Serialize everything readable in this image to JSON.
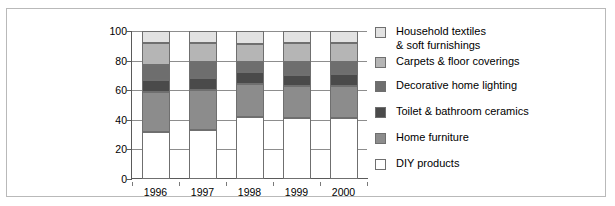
{
  "chart_data": {
    "type": "bar",
    "subtype": "stacked-bar-100",
    "title": "",
    "xlabel": "",
    "ylabel": "",
    "categories": [
      "1996",
      "1997",
      "1998",
      "1999",
      "2000"
    ],
    "ylim": [
      0,
      100
    ],
    "yticks": [
      0,
      20,
      40,
      60,
      80,
      100
    ],
    "ytick_labels": [
      "0",
      "20",
      "40",
      "60",
      "80",
      "100"
    ],
    "grid": true,
    "legend_position": "right",
    "stack_order_bottom_to_top": [
      "DIY products",
      "Home furniture",
      "Toilet & bathroom ceramics",
      "Decorative home lighting",
      "Carpets & floor coverings",
      "Household textiles & soft furnishings"
    ],
    "series": [
      {
        "name": "DIY products",
        "color": "#ffffff",
        "values": [
          32,
          33,
          42,
          41,
          41
        ],
        "cumulative_top": [
          32,
          33,
          42,
          41,
          41
        ]
      },
      {
        "name": "Home furniture",
        "color": "#8c8c8c",
        "values": [
          27,
          27,
          22,
          22,
          22
        ],
        "cumulative_top": [
          59,
          60,
          64,
          63,
          63
        ]
      },
      {
        "name": "Toilet & bathroom ceramics",
        "color": "#4a4a4a",
        "values": [
          8,
          8,
          8,
          7,
          8
        ],
        "cumulative_top": [
          67,
          68,
          72,
          70,
          71
        ]
      },
      {
        "name": "Decorative home lighting",
        "color": "#6e6e6e",
        "values": [
          10,
          11,
          7,
          9,
          8
        ],
        "cumulative_top": [
          77,
          79,
          79,
          79,
          79
        ]
      },
      {
        "name": "Carpets & floor coverings",
        "color": "#b5b5b5",
        "values": [
          15,
          13,
          12,
          13,
          13
        ],
        "cumulative_top": [
          92,
          92,
          91,
          92,
          92
        ]
      },
      {
        "name": "Household textiles & soft furnishings",
        "color": "#e2e2e2",
        "values": [
          8,
          8,
          9,
          8,
          8
        ],
        "cumulative_top": [
          100,
          100,
          100,
          100,
          100
        ]
      }
    ]
  },
  "legend": {
    "items": [
      {
        "label": "Household textiles\n& soft furnishings",
        "color": "#e2e2e2"
      },
      {
        "label": "Carpets & floor coverings",
        "color": "#b5b5b5"
      },
      {
        "label": "Decorative home lighting",
        "color": "#6e6e6e"
      },
      {
        "label": "Toilet & bathroom ceramics",
        "color": "#4a4a4a"
      },
      {
        "label": "Home furniture",
        "color": "#8c8c8c"
      },
      {
        "label": "DIY products",
        "color": "#ffffff"
      }
    ]
  },
  "colors": {
    "frame": "#b9b9b9",
    "axis": "#5a5a5a",
    "grid": "#8d8d8d",
    "segment_border": "#6f6f6f",
    "text": "#000000",
    "background": "#ffffff"
  }
}
